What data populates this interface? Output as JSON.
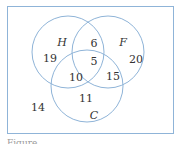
{
  "diagram": {
    "type": "venn-3-set",
    "colors": {
      "stroke": "#8fb4d8",
      "text": "#333333",
      "background": "#ffffff"
    },
    "sets": [
      {
        "name": "H",
        "label": "H"
      },
      {
        "name": "F",
        "label": "F"
      },
      {
        "name": "C",
        "label": "C"
      }
    ],
    "regions": {
      "H_only": "19",
      "F_only": "20",
      "C_only": "11",
      "H_and_F_only": "6",
      "H_and_C_only": "10",
      "F_and_C_only": "15",
      "H_and_F_and_C": "5",
      "outside": "14"
    },
    "caption": "Figure ..."
  }
}
